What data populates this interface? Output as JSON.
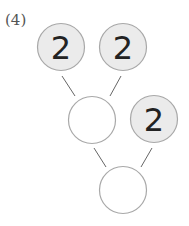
{
  "problem": {
    "label": "(4)"
  },
  "colors": {
    "filled_circle": "#ebebeb",
    "empty_circle": "#ffffff",
    "stroke": "#a8a8a8",
    "line": "#666666"
  },
  "diagram": {
    "nodes": [
      {
        "id": "top-left",
        "value": "2",
        "filled": true
      },
      {
        "id": "top-right",
        "value": "2",
        "filled": true
      },
      {
        "id": "middle",
        "value": "",
        "filled": false
      },
      {
        "id": "middle-right",
        "value": "2",
        "filled": true
      },
      {
        "id": "bottom",
        "value": "",
        "filled": false
      }
    ]
  }
}
